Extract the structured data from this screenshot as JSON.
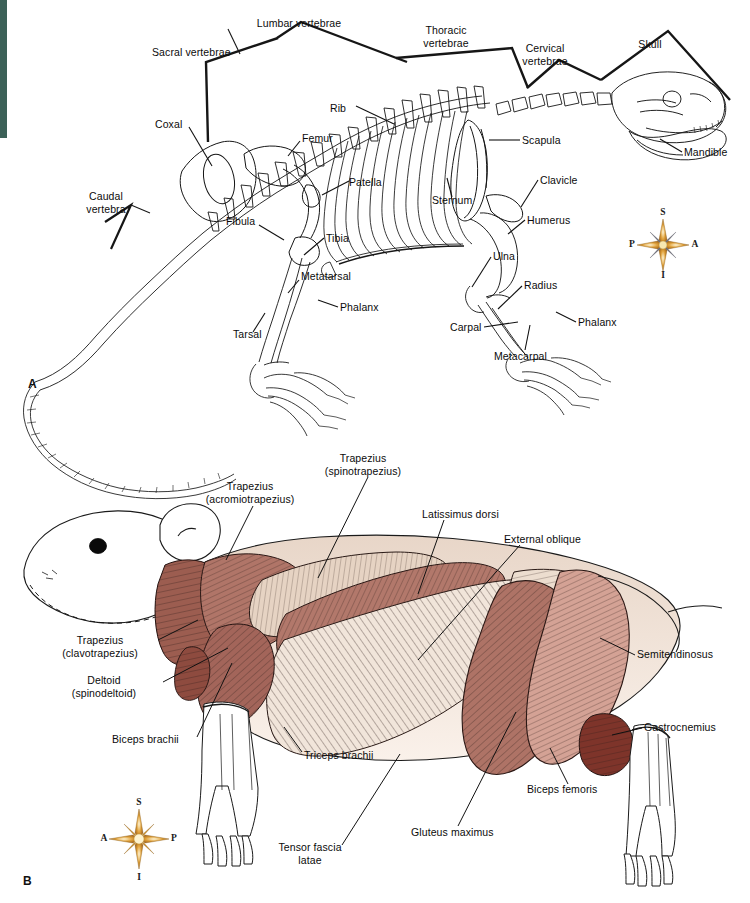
{
  "figure": {
    "panel_a_letter": "A",
    "panel_b_letter": "B",
    "background_color": "#ffffff",
    "accent_strip_color": "#3c6158",
    "line_color": "#111111",
    "muscle_colors": {
      "dark_red": "#8f5245",
      "mid_red": "#a8695c",
      "light_red": "#c08a7c",
      "pale_pink": "#d8ab9d",
      "cream": "#efe2d6",
      "deep_red": "#7d3228",
      "outline": "#1a1a1a"
    }
  },
  "panel_a": {
    "title": "Skeleton (lateral view)",
    "type": "skeletal-diagram",
    "labels": [
      {
        "text": "Lumbar vertebrae",
        "x": 299,
        "y": 17,
        "align": "center"
      },
      {
        "text": "Thoracic\nvertebrae",
        "x": 446,
        "y": 24,
        "align": "center"
      },
      {
        "text": "Cervical\nvertebrae",
        "x": 545,
        "y": 42,
        "align": "center"
      },
      {
        "text": "Skull",
        "x": 650,
        "y": 38,
        "align": "center"
      },
      {
        "text": "Sacral vertebrae",
        "x": 152,
        "y": 46,
        "align": "left"
      },
      {
        "text": "Rib",
        "x": 330,
        "y": 102,
        "align": "left"
      },
      {
        "text": "Scapula",
        "x": 522,
        "y": 138,
        "align": "left"
      },
      {
        "text": "Mandible",
        "x": 684,
        "y": 151,
        "align": "left"
      },
      {
        "text": "Coxal",
        "x": 155,
        "y": 124,
        "align": "left"
      },
      {
        "text": "Femur",
        "x": 302,
        "y": 134,
        "align": "left"
      },
      {
        "text": "Patella",
        "x": 351,
        "y": 180,
        "align": "left"
      },
      {
        "text": "Clavicle",
        "x": 540,
        "y": 178,
        "align": "left"
      },
      {
        "text": "Sternum",
        "x": 432,
        "y": 198,
        "align": "left"
      },
      {
        "text": "Caudal\nvertebra",
        "x": 85,
        "y": 196,
        "align": "left"
      },
      {
        "text": "Fibula",
        "x": 226,
        "y": 219,
        "align": "left"
      },
      {
        "text": "Humerus",
        "x": 527,
        "y": 218,
        "align": "left"
      },
      {
        "text": "Tibia",
        "x": 326,
        "y": 235,
        "align": "left"
      },
      {
        "text": "Ulna",
        "x": 493,
        "y": 254,
        "align": "left"
      },
      {
        "text": "Metatarsal",
        "x": 301,
        "y": 273,
        "align": "left"
      },
      {
        "text": "Radius",
        "x": 524,
        "y": 283,
        "align": "left"
      },
      {
        "text": "Phalanx",
        "x": 340,
        "y": 304,
        "align": "left"
      },
      {
        "text": "Phalanx",
        "x": 578,
        "y": 319,
        "align": "left"
      },
      {
        "text": "Carpal",
        "x": 450,
        "y": 325,
        "align": "left"
      },
      {
        "text": "Tarsal",
        "x": 233,
        "y": 331,
        "align": "left"
      },
      {
        "text": "Metacarpal",
        "x": 494,
        "y": 353,
        "align": "left"
      }
    ],
    "compass": {
      "superior": "S",
      "inferior": "I",
      "left": "P",
      "right": "A",
      "cx": 663,
      "cy": 245
    }
  },
  "panel_b": {
    "title": "Superficial muscles (lateral view)",
    "type": "muscle-diagram",
    "labels": [
      {
        "text": "Trapezius\n(spinotrapezius)",
        "x": 363,
        "y": 455,
        "align": "center"
      },
      {
        "text": "Trapezius\n(acromiotrapezius)",
        "x": 250,
        "y": 483,
        "align": "center"
      },
      {
        "text": "Latissimus dorsi",
        "x": 422,
        "y": 512,
        "align": "left"
      },
      {
        "text": "External oblique",
        "x": 504,
        "y": 536,
        "align": "left"
      },
      {
        "text": "Trapezius\n(clavotrapezius)",
        "x": 100,
        "y": 639,
        "align": "center"
      },
      {
        "text": "Semitendinosus",
        "x": 637,
        "y": 652,
        "align": "left"
      },
      {
        "text": "Deltoid\n(spinodeltoid)",
        "x": 107,
        "y": 679,
        "align": "center"
      },
      {
        "text": "Biceps brachii",
        "x": 132,
        "y": 738,
        "align": "left"
      },
      {
        "text": "Gastrocnemius",
        "x": 644,
        "y": 725,
        "align": "left"
      },
      {
        "text": "Triceps brachii",
        "x": 304,
        "y": 755,
        "align": "left"
      },
      {
        "text": "Biceps femoris",
        "x": 527,
        "y": 788,
        "align": "left"
      },
      {
        "text": "Gluteus maximus",
        "x": 411,
        "y": 831,
        "align": "left"
      },
      {
        "text": "Tensor fascia\nlatae",
        "x": 308,
        "y": 848,
        "align": "center"
      }
    ],
    "compass": {
      "superior": "S",
      "inferior": "I",
      "left": "A",
      "right": "P",
      "cx": 139,
      "cy": 839
    }
  }
}
